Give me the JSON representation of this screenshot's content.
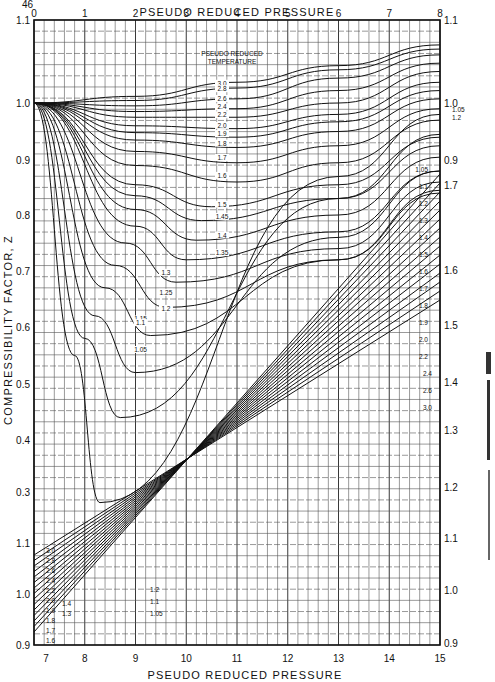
{
  "page": {
    "number": "46"
  },
  "chart_data": {
    "type": "line",
    "top_axis": {
      "label": "PSEUDO REDUCED PRESSURE",
      "ticks": [
        "0",
        "1",
        "2",
        "3",
        "4",
        "5",
        "6",
        "7",
        "8"
      ],
      "range": [
        0,
        8
      ]
    },
    "bottom_axis": {
      "label": "PSEUDO REDUCED PRESSURE",
      "ticks": [
        "7",
        "8",
        "9",
        "10",
        "11",
        "12",
        "13",
        "14",
        "15"
      ],
      "range": [
        7,
        15
      ]
    },
    "left_axis": {
      "label": "COMPRESSIBILITY FACTOR, Z",
      "upper_ticks": [
        "1.1",
        "1.0",
        "0.9",
        "0.8",
        "0.7",
        "0.6",
        "0.5",
        "0.4",
        "0.3"
      ],
      "lower_ticks": [
        "1.1",
        "1.0",
        "0.9"
      ]
    },
    "right_axis": {
      "upper_ticks": [
        "1.1",
        "1.0",
        "0.9"
      ],
      "middle_ticks": [
        "1.7",
        "1.6",
        "1.5",
        "1.4",
        "1.3",
        "1.2",
        "1.1",
        "1.0",
        "0.9"
      ]
    },
    "legend_title": [
      "PSEUDO REDUCED",
      "TEMPERATURE"
    ],
    "grid": true,
    "series_low_pressure": [
      {
        "name": "3.0",
        "points": [
          [
            0,
            1.0
          ],
          [
            2,
            1.008
          ],
          [
            4,
            1.025
          ],
          [
            6,
            1.045
          ],
          [
            8,
            1.07
          ]
        ]
      },
      {
        "name": "2.8",
        "points": [
          [
            0,
            1.0
          ],
          [
            2,
            1.003
          ],
          [
            4,
            1.018
          ],
          [
            6,
            1.04
          ],
          [
            8,
            1.065
          ]
        ]
      },
      {
        "name": "2.6",
        "points": [
          [
            0,
            1.0
          ],
          [
            2,
            0.995
          ],
          [
            4,
            1.005
          ],
          [
            6,
            1.03
          ],
          [
            8,
            1.058
          ]
        ]
      },
      {
        "name": "2.4",
        "points": [
          [
            0,
            1.0
          ],
          [
            2,
            0.985
          ],
          [
            4,
            0.99
          ],
          [
            6,
            1.015
          ],
          [
            8,
            1.048
          ]
        ]
      },
      {
        "name": "2.2",
        "points": [
          [
            0,
            1.0
          ],
          [
            2,
            0.975
          ],
          [
            4,
            0.975
          ],
          [
            6,
            1.0
          ],
          [
            8,
            1.038
          ]
        ]
      },
      {
        "name": "2.0",
        "points": [
          [
            0,
            1.0
          ],
          [
            2,
            0.96
          ],
          [
            4,
            0.955
          ],
          [
            6,
            0.98
          ],
          [
            8,
            1.025
          ]
        ]
      },
      {
        "name": "1.9",
        "points": [
          [
            0,
            1.0
          ],
          [
            2,
            0.948
          ],
          [
            4,
            0.94
          ],
          [
            6,
            0.967
          ],
          [
            8,
            1.015
          ]
        ]
      },
      {
        "name": "1.8",
        "points": [
          [
            0,
            1.0
          ],
          [
            2,
            0.935
          ],
          [
            4,
            0.922
          ],
          [
            6,
            0.95
          ],
          [
            8,
            1.005
          ]
        ]
      },
      {
        "name": "1.7",
        "points": [
          [
            0,
            1.0
          ],
          [
            2,
            0.915
          ],
          [
            4,
            0.895
          ],
          [
            6,
            0.925
          ],
          [
            8,
            0.99
          ]
        ]
      },
      {
        "name": "1.6",
        "points": [
          [
            0,
            1.0
          ],
          [
            2,
            0.89
          ],
          [
            4,
            0.86
          ],
          [
            6,
            0.895
          ],
          [
            8,
            0.97
          ]
        ]
      },
      {
        "name": "1.5",
        "points": [
          [
            0,
            1.0
          ],
          [
            2,
            0.855
          ],
          [
            3.5,
            0.815
          ],
          [
            6,
            0.855
          ],
          [
            8,
            0.94
          ]
        ]
      },
      {
        "name": "1.45",
        "points": [
          [
            0,
            1.0
          ],
          [
            2,
            0.835
          ],
          [
            3.3,
            0.79
          ],
          [
            6,
            0.83
          ],
          [
            8,
            0.925
          ]
        ]
      },
      {
        "name": "1.4",
        "points": [
          [
            0,
            1.0
          ],
          [
            2,
            0.81
          ],
          [
            3.2,
            0.755
          ],
          [
            6,
            0.8
          ],
          [
            8,
            0.905
          ]
        ]
      },
      {
        "name": "1.35",
        "points": [
          [
            0,
            1.0
          ],
          [
            2,
            0.78
          ],
          [
            3.0,
            0.72
          ],
          [
            6,
            0.77
          ],
          [
            8,
            0.88
          ]
        ]
      },
      {
        "name": "1.3",
        "points": [
          [
            0,
            1.0
          ],
          [
            1.8,
            0.75
          ],
          [
            2.8,
            0.68
          ],
          [
            6,
            0.74
          ],
          [
            8,
            0.86
          ]
        ]
      },
      {
        "name": "1.25",
        "points": [
          [
            0,
            1.0
          ],
          [
            1.6,
            0.71
          ],
          [
            2.6,
            0.635
          ],
          [
            6,
            0.72
          ],
          [
            8,
            0.84
          ]
        ]
      },
      {
        "name": "1.2",
        "points": [
          [
            0,
            1.0
          ],
          [
            1.4,
            0.67
          ],
          [
            2.3,
            0.585
          ],
          [
            6,
            0.72
          ],
          [
            8,
            0.845
          ]
        ]
      },
      {
        "name": "1.15",
        "points": [
          [
            0,
            1.0
          ],
          [
            1.2,
            0.62
          ],
          [
            2.0,
            0.52
          ],
          [
            6,
            0.76
          ],
          [
            8,
            0.88
          ]
        ]
      },
      {
        "name": "1.1",
        "points": [
          [
            0,
            1.0
          ],
          [
            1.0,
            0.58
          ],
          [
            1.7,
            0.44
          ],
          [
            6,
            0.83
          ],
          [
            8,
            0.945
          ]
        ]
      },
      {
        "name": "1.05",
        "points": [
          [
            0,
            1.0
          ],
          [
            0.8,
            0.55
          ],
          [
            1.3,
            0.28
          ],
          [
            6,
            0.87
          ],
          [
            8,
            0.98
          ]
        ]
      }
    ],
    "right_labels_upper": [
      "1.05",
      "1.2",
      "1.3",
      "1.1",
      "1.4",
      "1.5"
    ],
    "right_labels_middle": [
      "1.05",
      "1.1",
      "1.2",
      "1.3",
      "1.4",
      "1.5",
      "1.6",
      "1.7",
      "1.8",
      "1.9",
      "2.0",
      "2.2",
      "2.4",
      "2.6",
      "3.0"
    ],
    "series_high_pressure_left_labels": [
      "3.0",
      "2.8",
      "2.6",
      "2.4",
      "2.2",
      "2.0",
      "1.9",
      "1.8",
      "1.7",
      "1.6",
      "1.4",
      "1.3",
      "1.2",
      "1.1",
      "1.05"
    ]
  }
}
